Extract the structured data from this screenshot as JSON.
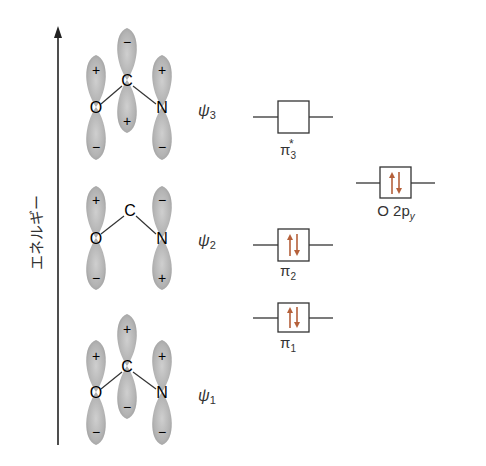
{
  "axis": {
    "label": "エネルギー",
    "direction": "up"
  },
  "atoms": {
    "o": "O",
    "c": "C",
    "n": "N"
  },
  "molecular_orbitals": [
    {
      "id": "psi3",
      "label": "ψ",
      "subscript": "3",
      "signs": {
        "o_top": "+",
        "o_bottom": "−",
        "c_top": "−",
        "c_bottom": "+",
        "n_top": "+",
        "n_bottom": "−"
      }
    },
    {
      "id": "psi2",
      "label": "ψ",
      "subscript": "2",
      "signs": {
        "o_top": "+",
        "o_bottom": "−",
        "n_top": "−",
        "n_bottom": "+"
      }
    },
    {
      "id": "psi1",
      "label": "ψ",
      "subscript": "1",
      "signs": {
        "o_top": "+",
        "o_bottom": "−",
        "c_top": "+",
        "c_bottom": "−",
        "n_top": "+",
        "n_bottom": "−"
      }
    }
  ],
  "energy_levels": [
    {
      "id": "pi3_star",
      "symbol": "π",
      "subscript": "3",
      "superscript": "*",
      "electrons": 0
    },
    {
      "id": "pi2",
      "symbol": "π",
      "subscript": "2",
      "superscript": "",
      "electrons": 2
    },
    {
      "id": "pi1",
      "symbol": "π",
      "subscript": "1",
      "superscript": "",
      "electrons": 2
    },
    {
      "id": "o2py",
      "symbol": "O 2p",
      "subscript": "y",
      "superscript": "",
      "electrons": 2
    }
  ],
  "colors": {
    "lobe": "#a9a9a9",
    "lobe_edge": "#8a8a8a",
    "line": "#333333",
    "electron_arrow": "#b5603a"
  }
}
